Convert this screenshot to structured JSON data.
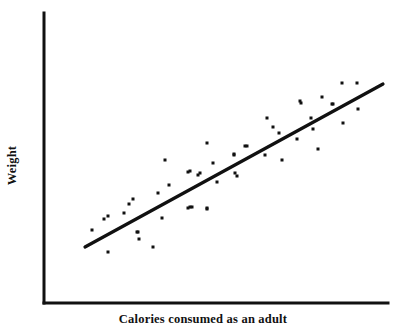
{
  "figure": {
    "background_color": "#ffffff",
    "ink_color": "#111111"
  },
  "axes": {
    "x_label": "Calories consumed as an adult",
    "y_label": "Weight",
    "line_color": "#111111",
    "line_width": 3,
    "origin": {
      "x": 44,
      "y": 303
    },
    "y_axis_top": {
      "x": 44,
      "y": 13
    },
    "x_axis_right": {
      "x": 388,
      "y": 303
    },
    "ticks": {
      "x": [],
      "y": []
    },
    "grid": false
  },
  "chart_data": {
    "type": "scatter",
    "title": "",
    "xlabel": "Calories consumed as an adult",
    "ylabel": "Weight",
    "xlim": [
      44,
      388
    ],
    "ylim": [
      303,
      13
    ],
    "grid": false,
    "legend": "none",
    "marker": {
      "shape": "square",
      "size_px": 3,
      "color": "#111111"
    },
    "points": [
      {
        "x": 92,
        "y": 230
      },
      {
        "x": 104,
        "y": 219
      },
      {
        "x": 108,
        "y": 252
      },
      {
        "x": 108,
        "y": 216
      },
      {
        "x": 124,
        "y": 213
      },
      {
        "x": 129,
        "y": 204
      },
      {
        "x": 133,
        "y": 199
      },
      {
        "x": 137,
        "y": 232
      },
      {
        "x": 139,
        "y": 239
      },
      {
        "x": 138,
        "y": 232
      },
      {
        "x": 153,
        "y": 247
      },
      {
        "x": 158,
        "y": 193
      },
      {
        "x": 162,
        "y": 218
      },
      {
        "x": 165,
        "y": 160
      },
      {
        "x": 169,
        "y": 185
      },
      {
        "x": 188,
        "y": 172
      },
      {
        "x": 190,
        "y": 171
      },
      {
        "x": 190,
        "y": 207
      },
      {
        "x": 192,
        "y": 207
      },
      {
        "x": 188,
        "y": 208
      },
      {
        "x": 198,
        "y": 175
      },
      {
        "x": 200,
        "y": 173
      },
      {
        "x": 207,
        "y": 143
      },
      {
        "x": 207,
        "y": 209
      },
      {
        "x": 207,
        "y": 208
      },
      {
        "x": 213,
        "y": 163
      },
      {
        "x": 217,
        "y": 182
      },
      {
        "x": 234,
        "y": 155
      },
      {
        "x": 234,
        "y": 154
      },
      {
        "x": 235,
        "y": 173
      },
      {
        "x": 237,
        "y": 176
      },
      {
        "x": 245,
        "y": 146
      },
      {
        "x": 247,
        "y": 146
      },
      {
        "x": 265,
        "y": 155
      },
      {
        "x": 267,
        "y": 118
      },
      {
        "x": 273,
        "y": 127
      },
      {
        "x": 279,
        "y": 133
      },
      {
        "x": 282,
        "y": 160
      },
      {
        "x": 297,
        "y": 139
      },
      {
        "x": 300,
        "y": 101
      },
      {
        "x": 301,
        "y": 103
      },
      {
        "x": 311,
        "y": 118
      },
      {
        "x": 313,
        "y": 129
      },
      {
        "x": 318,
        "y": 149
      },
      {
        "x": 322,
        "y": 97
      },
      {
        "x": 332,
        "y": 104
      },
      {
        "x": 333,
        "y": 104
      },
      {
        "x": 342,
        "y": 83
      },
      {
        "x": 343,
        "y": 123
      },
      {
        "x": 357,
        "y": 83
      },
      {
        "x": 358,
        "y": 109
      }
    ],
    "trendline": {
      "label": "regression line",
      "color": "#111111",
      "width": 3.2,
      "x1": 85,
      "y1": 247,
      "x2": 383,
      "y2": 84
    }
  }
}
